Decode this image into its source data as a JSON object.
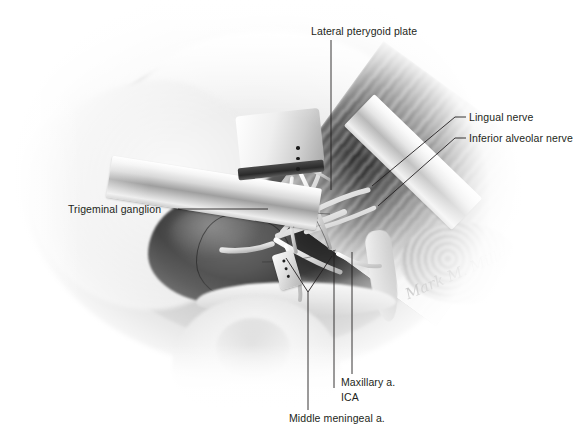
{
  "figure": {
    "type": "anatomical-dissection-photograph",
    "rendering": "grayscale photograph with white vignette on white page",
    "signature": "Mark M. Miller",
    "caption": ""
  },
  "labels": [
    {
      "id": "lateral-pterygoid-plate",
      "text": "Lateral pterygoid plate",
      "position": "top-center",
      "leader": "vertical line descending from label into the operative field"
    },
    {
      "id": "lingual-nerve",
      "text": "Lingual nerve",
      "position": "right-upper",
      "leader": "short dash then diagonal line descending left to nerve"
    },
    {
      "id": "inferior-alveolar-nerve",
      "text": "Inferior alveolar nerve",
      "position": "right-upper",
      "leader": "short dash then diagonal line descending left to nerve"
    },
    {
      "id": "trigeminal-ganglion",
      "text": "Trigeminal ganglion",
      "position": "left-middle",
      "leader": "horizontal line running right to the ganglion"
    },
    {
      "id": "maxillary-artery",
      "text": "Maxillary a.",
      "position": "bottom-center-right",
      "leader": "vertical line ascending into the field"
    },
    {
      "id": "ica",
      "text": "ICA",
      "position": "bottom-center-right",
      "leader": "vertical line ascending into the field"
    },
    {
      "id": "middle-meningeal-artery",
      "text": "Middle meningeal a.",
      "position": "bottom-center",
      "leader": "vertical line ascending to a V-shaped fork in the field"
    }
  ],
  "structures": [
    {
      "name": "trigeminal-ganglion",
      "tone": "dark-gray lobulated mass, left of center"
    },
    {
      "name": "lateral-pterygoid-plate",
      "tone": "pale bony plate, center"
    },
    {
      "name": "lingual-nerve",
      "tone": "pale white cord descending from nerve trunk"
    },
    {
      "name": "inferior-alveolar-nerve",
      "tone": "pale white cord, lateral to lingual nerve"
    },
    {
      "name": "maxillary-artery",
      "tone": "pale vessel crossing the field"
    },
    {
      "name": "middle-meningeal-artery",
      "tone": "pale vessel ascending in the field"
    },
    {
      "name": "internal-carotid-artery",
      "tone": "deep vessel in the dark recess"
    },
    {
      "name": "temporalis-pterygoid-muscle",
      "tone": "dark striated fibers, upper right"
    },
    {
      "name": "external-ear",
      "tone": "pale soft tissue, lower center"
    }
  ],
  "instruments": [
    {
      "name": "retractor-blade-left",
      "tone": "bright metallic band over the ganglion"
    },
    {
      "name": "retractor-blade-right",
      "tone": "bright metallic band over the muscle, upper right"
    },
    {
      "name": "retractor-blade-top",
      "tone": "metallic blade with rivet holes, upper center"
    },
    {
      "name": "surgical-clip",
      "tone": "small metallic clip, lower center"
    }
  ]
}
